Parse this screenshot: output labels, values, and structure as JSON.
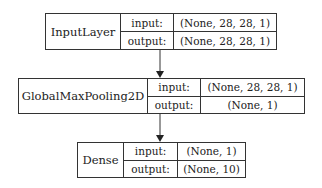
{
  "diagram": {
    "type": "keras-model-plot",
    "layers": [
      {
        "name": "InputLayer",
        "input_label": "input:",
        "input_shape": "(None, 28, 28, 1)",
        "output_label": "output:",
        "output_shape": "(None, 28, 28, 1)"
      },
      {
        "name": "GlobalMaxPooling2D",
        "input_label": "input:",
        "input_shape": "(None, 28, 28, 1)",
        "output_label": "output:",
        "output_shape": "(None, 1)"
      },
      {
        "name": "Dense",
        "input_label": "input:",
        "input_shape": "(None, 1)",
        "output_label": "output:",
        "output_shape": "(None, 10)"
      }
    ],
    "edges": [
      {
        "from": "InputLayer",
        "to": "GlobalMaxPooling2D"
      },
      {
        "from": "GlobalMaxPooling2D",
        "to": "Dense"
      }
    ],
    "colors": {
      "stroke": "#333333",
      "background": "#ffffff",
      "text": "#222222"
    }
  }
}
